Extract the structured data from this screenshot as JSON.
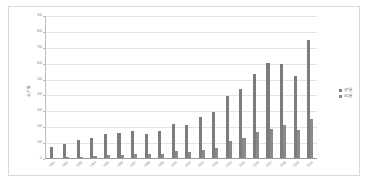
{
  "chart_data": {
    "type": "bar",
    "title": "",
    "xlabel": "",
    "ylabel": "总产量",
    "ylim": [
      0,
      900
    ],
    "ytick_step": 100,
    "yticks": [
      "900",
      "800",
      "700",
      "600",
      "500",
      "400",
      "300",
      "200",
      "100",
      "0"
    ],
    "grid": true,
    "legend_position": "right",
    "categories": [
      "1991",
      "1992",
      "1993",
      "1994",
      "1995",
      "1996",
      "1997",
      "1998",
      "1999",
      "2000",
      "2001",
      "2002",
      "2003",
      "2004",
      "2005",
      "2006",
      "2007",
      "2008",
      "2009",
      "2010"
    ],
    "series": [
      {
        "name": "总产量",
        "color": "#7d7d7d",
        "values": [
          68,
          92,
          115,
          130,
          155,
          160,
          170,
          152,
          172,
          215,
          208,
          258,
          290,
          395,
          440,
          530,
          600,
          595,
          520,
          745
        ]
      },
      {
        "name": "出口量",
        "color": "#8a8a8a",
        "values": [
          0,
          4,
          6,
          10,
          22,
          20,
          24,
          25,
          28,
          42,
          40,
          52,
          62,
          108,
          128,
          168,
          185,
          212,
          180,
          245
        ]
      }
    ]
  },
  "legend": {
    "items": [
      {
        "label": "总产量"
      },
      {
        "label": "出口量"
      }
    ]
  }
}
